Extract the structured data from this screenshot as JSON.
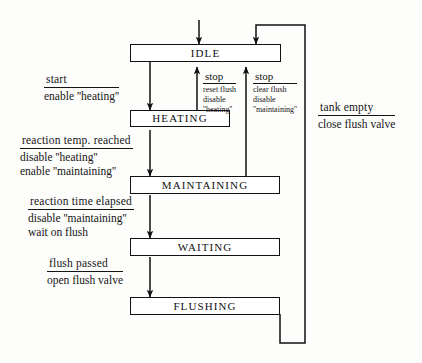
{
  "diagram": {
    "type": "state-transition-diagram",
    "ink_color": "#111111",
    "background_color": "#fdfdfc",
    "states": [
      {
        "id": "idle",
        "label": "IDLE"
      },
      {
        "id": "heating",
        "label": "HEATING"
      },
      {
        "id": "maintaining",
        "label": "MAINTAINING"
      },
      {
        "id": "waiting",
        "label": "WAITING"
      },
      {
        "id": "flushing",
        "label": "FLUSHING"
      }
    ],
    "transitions": [
      {
        "id": "start",
        "from": "idle",
        "to": "heating",
        "trigger": "start",
        "actions": [
          "enable ''heating''"
        ]
      },
      {
        "id": "temp-reached",
        "from": "heating",
        "to": "maintaining",
        "trigger": "reaction temp. reached",
        "actions": [
          "disable ''heating''",
          "enable ''maintaining''"
        ]
      },
      {
        "id": "time-elapsed",
        "from": "maintaining",
        "to": "waiting",
        "trigger": "reaction time elapsed",
        "actions": [
          "disable ''maintaining''",
          "wait on flush"
        ]
      },
      {
        "id": "flush-passed",
        "from": "waiting",
        "to": "flushing",
        "trigger": "flush passed",
        "actions": [
          "open flush valve"
        ]
      },
      {
        "id": "stop-heating",
        "from": "heating",
        "to": "idle",
        "trigger": "stop",
        "actions": [
          "reset flush",
          "disable",
          "''heating''"
        ]
      },
      {
        "id": "stop-maintaining",
        "from": "maintaining",
        "to": "idle",
        "trigger": "stop",
        "actions": [
          "clear flush",
          "disable",
          "''maintaining''"
        ]
      },
      {
        "id": "tank-empty",
        "from": "flushing",
        "to": "idle",
        "trigger": "tank empty",
        "actions": [
          "close flush valve"
        ]
      }
    ]
  }
}
